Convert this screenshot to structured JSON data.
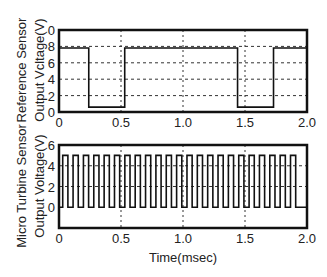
{
  "chart_data": [
    {
      "type": "line",
      "title": "",
      "xlabel": "",
      "ylabel": [
        "Reference Sensor",
        "Output Vcltage(V)"
      ],
      "xlim": [
        0,
        2.0
      ],
      "ylim": [
        0,
        10
      ],
      "xticks": [
        0,
        0.5,
        1.0,
        1.5,
        2.0
      ],
      "xtick_labels": [
        "0",
        "0.5",
        "1.0",
        "1.5",
        "2.0"
      ],
      "yticks": [
        0,
        2,
        4,
        6,
        8,
        10
      ],
      "ytick_labels": [
        "0",
        "2",
        "4",
        "6",
        "8",
        "0"
      ],
      "grid": {
        "horizontal": [
          2,
          4,
          6,
          8
        ],
        "vertical": [
          0.5,
          1.0,
          1.5
        ],
        "style": "dotted"
      },
      "series": [
        {
          "name": "Reference sensor output",
          "x": [
            0,
            0.24,
            0.24,
            0.53,
            0.53,
            1.44,
            1.44,
            1.73,
            1.73,
            2.0
          ],
          "y": [
            7.8,
            7.8,
            0.6,
            0.6,
            7.8,
            7.8,
            0.6,
            0.6,
            7.8,
            7.8
          ]
        }
      ]
    },
    {
      "type": "line",
      "title": "",
      "xlabel": "Time(msec)",
      "ylabel": [
        "Micro Turbine Sensor",
        "Output Voltage(V)"
      ],
      "xlim": [
        0,
        2.0
      ],
      "ylim": [
        -2,
        6
      ],
      "xticks": [
        0,
        0.5,
        1.0,
        1.5,
        2.0
      ],
      "xtick_labels": [
        "0",
        "0.5",
        "1.0",
        "1.5",
        "2.0"
      ],
      "yticks": [
        0,
        2,
        4,
        6
      ],
      "ytick_labels": [
        "0",
        "2",
        "4",
        "6"
      ],
      "grid": {
        "horizontal": [
          2,
          4
        ],
        "vertical": [
          0.5,
          1.0,
          1.5
        ],
        "style": "dotted"
      },
      "series": [
        {
          "name": "Micro turbine sensor output (square wave)",
          "pulse_train": {
            "start": 0.03,
            "period": 0.0835,
            "duty": 0.5,
            "count": 23,
            "high": 5,
            "low": 0,
            "end": 1.97
          }
        }
      ]
    }
  ]
}
